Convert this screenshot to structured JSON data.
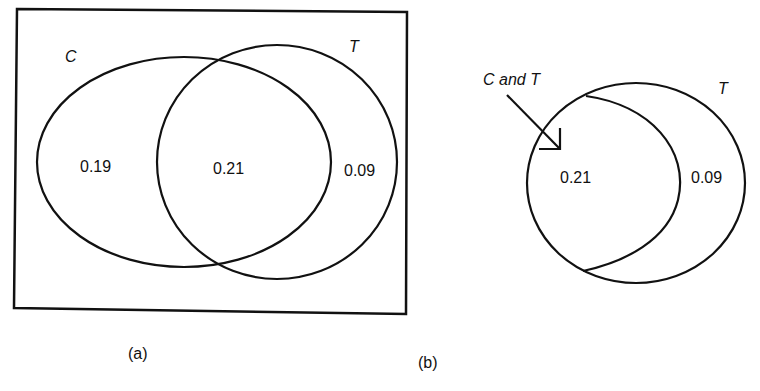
{
  "figure_a": {
    "caption": "(a)",
    "set_labels": {
      "c": "C",
      "t": "T"
    },
    "regions": {
      "c_only": "0.19",
      "c_and_t": "0.21",
      "t_only": "0.09"
    }
  },
  "figure_b": {
    "caption": "(b)",
    "set_label_t": "T",
    "arrow_label": "C and T",
    "regions": {
      "c_and_t": "0.21",
      "t_only": "0.09"
    }
  },
  "colors": {
    "stroke": "#111111",
    "background": "#ffffff"
  }
}
